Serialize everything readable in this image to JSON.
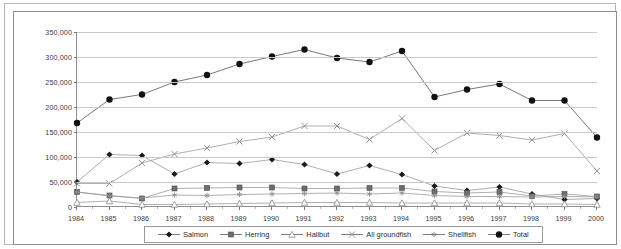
{
  "chart_data": {
    "type": "line",
    "title": "",
    "xlabel": "",
    "ylabel": "",
    "x": [
      1984,
      1985,
      1986,
      1987,
      1988,
      1989,
      1990,
      1991,
      1992,
      1993,
      1994,
      1995,
      1996,
      1997,
      1998,
      1999,
      2000
    ],
    "categories": [
      "1984",
      "1985",
      "1986",
      "1987",
      "1988",
      "1989",
      "1990",
      "1991",
      "1992",
      "1993",
      "1994",
      "1995",
      "1996",
      "1997",
      "1998",
      "1999",
      "2000"
    ],
    "ylim": [
      0,
      350000
    ],
    "ytick_values": [
      0,
      50000,
      100000,
      150000,
      200000,
      250000,
      300000,
      350000
    ],
    "ytick_labels": [
      "0",
      "50,000",
      "100,000",
      "150,000",
      "200,000",
      "250,000",
      "300,000",
      "350,000"
    ],
    "grid": true,
    "legend_position": "bottom",
    "series": [
      {
        "name": "Salmon",
        "marker": "diamond",
        "color": "#1a1a1a",
        "values": [
          50000,
          105000,
          103000,
          66000,
          89000,
          87000,
          95000,
          85000,
          66000,
          83000,
          65000,
          42000,
          33000,
          40000,
          26000,
          15000,
          17000
        ]
      },
      {
        "name": "Herring",
        "marker": "square",
        "color": "#6e6e6e",
        "values": [
          30000,
          23000,
          17000,
          37000,
          38000,
          39000,
          39000,
          37000,
          37000,
          38000,
          38000,
          31000,
          28000,
          30000,
          22000,
          26000,
          21000
        ]
      },
      {
        "name": "Halibut",
        "marker": "triangle",
        "color": "#8a8a8a",
        "values": [
          9000,
          12000,
          5000,
          5000,
          6000,
          7000,
          8000,
          9000,
          9000,
          9000,
          8000,
          8000,
          8000,
          8000,
          6000,
          6000,
          5000
        ]
      },
      {
        "name": "All groundfish",
        "marker": "cross",
        "color": "#8a8a8a",
        "values": [
          47000,
          47000,
          88000,
          106000,
          118000,
          131000,
          140000,
          162000,
          162000,
          135000,
          177000,
          113000,
          148000,
          143000,
          134000,
          147000,
          72000
        ]
      },
      {
        "name": "Shellfish",
        "marker": "star",
        "color": "#8a8a8a",
        "values": [
          30000,
          22000,
          18000,
          24000,
          23000,
          25000,
          26000,
          27000,
          28000,
          26000,
          28000,
          23000,
          21000,
          21000,
          20000,
          21000,
          20000
        ]
      },
      {
        "name": "Total",
        "marker": "circle",
        "color": "#111111",
        "values": [
          168000,
          215000,
          225000,
          250000,
          264000,
          286000,
          301000,
          315000,
          298000,
          290000,
          312000,
          220000,
          235000,
          246000,
          213000,
          213000,
          139000
        ]
      }
    ]
  },
  "legend": {
    "items": [
      {
        "label": "Salmon",
        "marker": "diamond"
      },
      {
        "label": "Herring",
        "marker": "square"
      },
      {
        "label": "Halibut",
        "marker": "triangle"
      },
      {
        "label": "All groundfish",
        "marker": "cross"
      },
      {
        "label": "Shellfish",
        "marker": "star"
      },
      {
        "label": "Total",
        "marker": "circle"
      }
    ]
  },
  "colors": {
    "grid": "#c9c9c9",
    "axis": "#8f8f8f",
    "frame_outer": "#b6b6b6",
    "frame_inner": "#8c8c8c",
    "text": "#3b3b3b",
    "dark_series": "#1a1a1a",
    "light_series": "#8a8a8a",
    "mid_series": "#6e6e6e"
  }
}
